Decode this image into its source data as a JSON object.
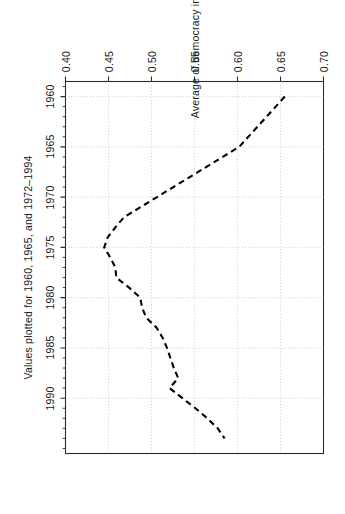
{
  "chart_data": {
    "type": "line",
    "title": "",
    "subtitle": "",
    "xlabel": "",
    "ylabel": "Average of democracy indicator",
    "caption": "Values plotted for 1960, 1965, and 1972–1994",
    "orientation": "rotated-90-clockwise",
    "grid": true,
    "legend": null,
    "line_style": "dashed",
    "line_color": "#000000",
    "xlim": [
      1958.5,
      1995.5
    ],
    "ylim": [
      0.4,
      0.7
    ],
    "xticks": [
      1960,
      1965,
      1970,
      1975,
      1980,
      1985,
      1990
    ],
    "xtick_labels": [
      "1960",
      "1965",
      "1970",
      "1975",
      "1980",
      "1985",
      "1990"
    ],
    "yticks": [
      0.4,
      0.45,
      0.5,
      0.55,
      0.6,
      0.65,
      0.7
    ],
    "ytick_labels": [
      "0.40",
      "0.45",
      "0.50",
      "0.55",
      "0.60",
      "0.65",
      "0.70"
    ],
    "x": [
      1960,
      1965,
      1972,
      1973,
      1974,
      1975,
      1976,
      1977,
      1978,
      1979,
      1980,
      1981,
      1982,
      1983,
      1984,
      1985,
      1986,
      1987,
      1988,
      1989,
      1990,
      1991,
      1992,
      1993,
      1994
    ],
    "y": [
      0.655,
      0.602,
      0.468,
      0.458,
      0.449,
      0.445,
      0.452,
      0.458,
      0.459,
      0.474,
      0.487,
      0.489,
      0.494,
      0.506,
      0.513,
      0.518,
      0.522,
      0.526,
      0.531,
      0.521,
      0.536,
      0.551,
      0.565,
      0.577,
      0.585
    ],
    "series": [
      {
        "name": "Average of democracy indicator",
        "values": [
          0.655,
          0.602,
          0.468,
          0.458,
          0.449,
          0.445,
          0.452,
          0.458,
          0.459,
          0.474,
          0.487,
          0.489,
          0.494,
          0.506,
          0.513,
          0.518,
          0.522,
          0.526,
          0.531,
          0.521,
          0.536,
          0.551,
          0.565,
          0.577,
          0.585
        ]
      }
    ]
  },
  "axes": {
    "y_axis_title": "Average of democracy indicator",
    "x_caption": "Values plotted for 1960, 1965, and 1972–1994",
    "y_tick_0": "0.70",
    "y_tick_1": "0.65",
    "y_tick_2": "0.60",
    "y_tick_3": "0.55",
    "y_tick_4": "0.50",
    "y_tick_5": "0.45",
    "y_tick_6": "0.40",
    "x_tick_0": "1960",
    "x_tick_1": "1965",
    "x_tick_2": "1970",
    "x_tick_3": "1975",
    "x_tick_4": "1980",
    "x_tick_5": "1985",
    "x_tick_6": "1990"
  },
  "style": {
    "line_color": "#000000",
    "frame_color": "#2b2b2b",
    "grid_color": "#bfbfbf",
    "text_color": "#1a1a1a",
    "background": "#ffffff"
  }
}
